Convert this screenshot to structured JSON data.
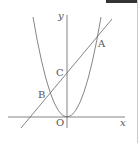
{
  "diagram": {
    "axes": {
      "x_label": "x",
      "y_label": "y",
      "origin_label": "O"
    },
    "points": [
      {
        "name": "A",
        "description": "intersection of line and parabola (right)"
      },
      {
        "name": "B",
        "description": "intersection of line and parabola (left)"
      },
      {
        "name": "C",
        "description": "y-intercept of line"
      }
    ],
    "curves": [
      "parabola with vertex at origin",
      "straight line through B, C, A"
    ],
    "colors": {
      "stroke": "#666666",
      "text": "#555555",
      "topbar": "#333333"
    }
  }
}
